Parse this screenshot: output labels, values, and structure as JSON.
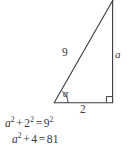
{
  "figure": {
    "type": "right-triangle-diagram",
    "stroke_color": "#3a3940",
    "background_color": "#ffffff",
    "labels": {
      "hypotenuse": "9",
      "opposite_side": "a",
      "adjacent_side": "2",
      "angle": "α"
    },
    "markers": {
      "right_angle": "square-marker-at-bottom-right",
      "angle_arc": "arc-at-left-vertex"
    },
    "vertices": {
      "left": [
        54,
        103
      ],
      "bottom_right": [
        113,
        103
      ],
      "top_right": [
        113,
        0
      ]
    }
  },
  "equations": {
    "line1": {
      "lhs_var": "a",
      "lhs_exp": "2",
      "plus": "+",
      "term2_num": "2",
      "term2_exp": "2",
      "equals": "=",
      "rhs_num": "9",
      "rhs_exp": "2",
      "plain": "a² + 2² = 9²"
    },
    "line2": {
      "lhs_var": "a",
      "lhs_exp": "2",
      "plus": "+",
      "term2_num": "4",
      "equals": "=",
      "rhs_num": "81",
      "plain": "a² + 4 = 81"
    }
  }
}
